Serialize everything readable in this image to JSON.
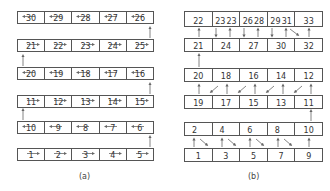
{
  "diagram_a": {
    "caption": "(a)",
    "rows": [
      {
        "cells": [
          "30",
          "29",
          "28",
          "27",
          "26"
        ],
        "direction": "left"
      },
      {
        "cells": [
          "21",
          "22",
          "23",
          "24",
          "25"
        ],
        "direction": "right"
      },
      {
        "cells": [
          "20",
          "19",
          "18",
          "17",
          "16"
        ],
        "direction": "left"
      },
      {
        "cells": [
          "11",
          "12",
          "13",
          "14",
          "15"
        ],
        "direction": "right"
      },
      {
        "cells": [
          "10",
          "9",
          "8",
          "7",
          "6"
        ],
        "direction": "left"
      },
      {
        "cells": [
          "1",
          "2",
          "3",
          "4",
          "5"
        ],
        "direction": "right"
      }
    ]
  },
  "diagram_b": {
    "caption": "(b)",
    "rows": [
      {
        "cells": [
          "22",
          [
            "23",
            "23"
          ],
          [
            "26",
            "28"
          ],
          [
            "29",
            "31"
          ],
          "33"
        ]
      },
      {
        "cells": [
          "21",
          "24",
          "27",
          "30",
          "32"
        ]
      },
      {
        "cells": [
          "20",
          "18",
          "16",
          "14",
          "12"
        ]
      },
      {
        "cells": [
          "19",
          "17",
          "15",
          "13",
          "11"
        ]
      },
      {
        "cells": [
          "2",
          "4",
          "6",
          "8",
          "10"
        ]
      },
      {
        "cells": [
          "1",
          "3",
          "5",
          "7",
          "9"
        ]
      }
    ]
  },
  "colors": {
    "line": "#555555",
    "arrow": "#666666",
    "text": "#333333"
  }
}
